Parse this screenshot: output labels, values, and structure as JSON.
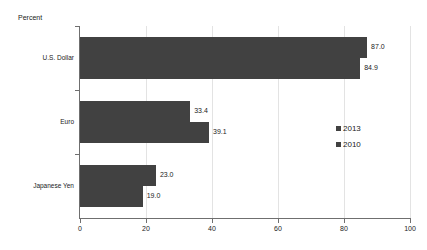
{
  "chart_data": {
    "type": "bar",
    "orientation": "horizontal",
    "title": "",
    "ylabel": "Percent",
    "xlabel": "",
    "categories": [
      "U.S. Dollar",
      "Euro",
      "Japanese Yen"
    ],
    "series": [
      {
        "name": "2013",
        "values": [
          87.0,
          33.4,
          23.0
        ]
      },
      {
        "name": "2010",
        "values": [
          84.9,
          39.1,
          19.0
        ]
      }
    ],
    "value_labels": [
      [
        "87.0",
        "84.9"
      ],
      [
        "33.4",
        "39.1"
      ],
      [
        "23.0",
        "19.0"
      ]
    ],
    "xlim": [
      0,
      100
    ],
    "xticks": [
      0,
      20,
      40,
      60,
      80,
      100
    ],
    "xtick_labels": [
      "0",
      "20",
      "40",
      "60",
      "80",
      "100"
    ],
    "grid": true,
    "legend_position": "right",
    "bar_color": "#414141",
    "grid_color": "#e3e3e3",
    "axis_color": "#6f6f6f"
  },
  "axis": {
    "y_title": "Percent"
  },
  "legend": {
    "entries": [
      {
        "label": "2013"
      },
      {
        "label": "2010"
      }
    ]
  }
}
